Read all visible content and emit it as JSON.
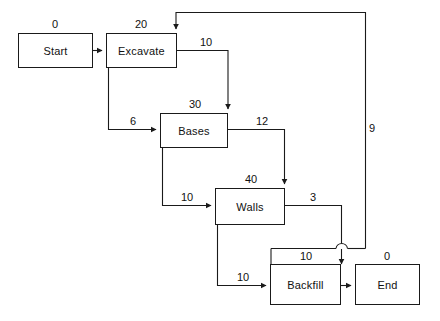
{
  "diagram": {
    "type": "activity-on-node-network",
    "stroke_color": "#1a1a1a",
    "background_color": "#ffffff",
    "nodes": [
      {
        "id": "start",
        "label": "Start",
        "duration": "0"
      },
      {
        "id": "excavate",
        "label": "Excavate",
        "duration": "20"
      },
      {
        "id": "bases",
        "label": "Bases",
        "duration": "30"
      },
      {
        "id": "walls",
        "label": "Walls",
        "duration": "40"
      },
      {
        "id": "backfill",
        "label": "Backfill",
        "duration": "10"
      },
      {
        "id": "end",
        "label": "End",
        "duration": "0"
      }
    ],
    "edges": [
      {
        "id": "start-excavate",
        "from": "start",
        "to": "excavate",
        "label": ""
      },
      {
        "id": "excavate-bases-10",
        "from": "excavate",
        "to": "bases",
        "label": "10"
      },
      {
        "id": "excavate-bases-6",
        "from": "excavate",
        "to": "bases",
        "label": "6"
      },
      {
        "id": "bases-walls-12",
        "from": "bases",
        "to": "walls",
        "label": "12"
      },
      {
        "id": "bases-walls-10",
        "from": "bases",
        "to": "walls",
        "label": "10"
      },
      {
        "id": "walls-backfill-3",
        "from": "walls",
        "to": "backfill",
        "label": "3"
      },
      {
        "id": "walls-backfill-10",
        "from": "walls",
        "to": "backfill",
        "label": "10"
      },
      {
        "id": "backfill-end",
        "from": "backfill",
        "to": "end",
        "label": ""
      },
      {
        "id": "backfill-excavate-9",
        "from": "backfill",
        "to": "excavate",
        "label": "9"
      }
    ]
  }
}
